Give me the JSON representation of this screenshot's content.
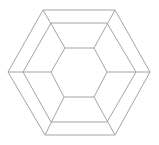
{
  "diagram": {
    "type": "nested-hexagons",
    "stroke_color": "#9a9a9a",
    "background": "#ffffff",
    "hexagons": [
      {
        "name": "outer",
        "points": "43,10 115,10 150,72 115,135 45,135 8,72"
      },
      {
        "name": "middle",
        "points": "51,23 107,23 136,72 107,122 51,122 23,72"
      },
      {
        "name": "inner",
        "points": "65,48 94,48 107,72 94,97 64,97 51,72"
      }
    ],
    "spokes": [
      {
        "x1": 43,
        "y1": 10,
        "x2": 65,
        "y2": 48
      },
      {
        "x1": 115,
        "y1": 10,
        "x2": 94,
        "y2": 48
      },
      {
        "x1": 150,
        "y1": 72,
        "x2": 107,
        "y2": 72
      },
      {
        "x1": 115,
        "y1": 135,
        "x2": 94,
        "y2": 97
      },
      {
        "x1": 45,
        "y1": 135,
        "x2": 64,
        "y2": 97
      },
      {
        "x1": 8,
        "y1": 72,
        "x2": 51,
        "y2": 72
      }
    ],
    "caption": ""
  }
}
